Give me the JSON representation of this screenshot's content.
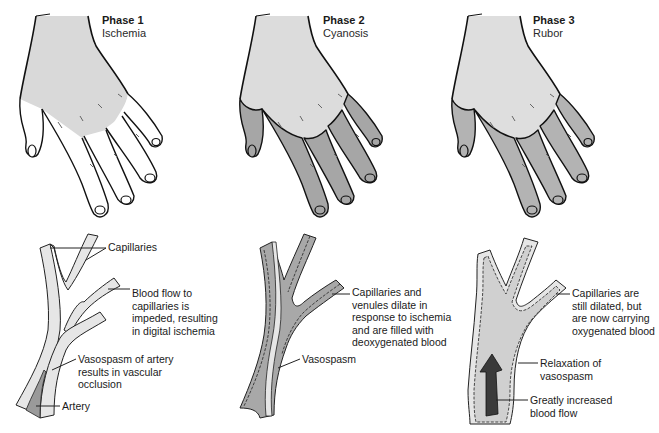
{
  "colors": {
    "background": "#ffffff",
    "outline": "#111111",
    "light_fill": "#d9d9d9",
    "dark_fill": "#a6a6a6",
    "vessel_wall": "#e4e4e4",
    "arrow": "#444444"
  },
  "phases": [
    {
      "title": "Phase 1",
      "subtitle": "Ischemia",
      "hand": {
        "palm_fill": "light",
        "finger_fill": "white"
      },
      "vessel": {
        "lumen_fill": "white",
        "labels": [
          {
            "text": "Capillaries"
          },
          {
            "text": "Blood flow to\ncapillaries is\nimpeded, resulting\nin digital ischemia"
          },
          {
            "text": "Vasospasm of artery\nresults in vascular\nocclusion"
          },
          {
            "text": "Artery"
          }
        ]
      }
    },
    {
      "title": "Phase 2",
      "subtitle": "Cyanosis",
      "hand": {
        "palm_fill": "light",
        "finger_fill": "dark"
      },
      "vessel": {
        "lumen_fill": "dark",
        "labels": [
          {
            "text": "Capillaries and\nvenules dilate in\nresponse to ischemia\nand are filled with\ndeoxygenated blood"
          },
          {
            "text": "Vasospasm"
          }
        ]
      }
    },
    {
      "title": "Phase 3",
      "subtitle": "Rubor",
      "hand": {
        "palm_fill": "light",
        "finger_fill": "mid"
      },
      "vessel": {
        "lumen_fill": "light",
        "arrow": "up-arrow",
        "labels": [
          {
            "text": "Capillaries are\nstill dilated, but\nare now carrying\noxygenated blood"
          },
          {
            "text": "Relaxation of\nvasospasm"
          },
          {
            "text": "Greatly increased\nblood flow"
          }
        ]
      }
    }
  ]
}
